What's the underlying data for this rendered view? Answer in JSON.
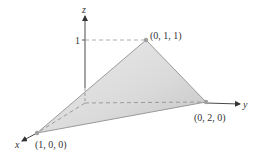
{
  "diagram": {
    "type": "3d-plane-triangle",
    "axes": {
      "x": {
        "label": "x"
      },
      "y": {
        "label": "y"
      },
      "z": {
        "label": "z",
        "tick": "1"
      }
    },
    "vertices": [
      {
        "label": "(1, 0, 0)"
      },
      {
        "label": "(0, 2, 0)"
      },
      {
        "label": "(0, 1, 1)"
      }
    ],
    "colors": {
      "axis": "#333333",
      "edge": "#9a9a9a",
      "fill_light": "#e8e8e8",
      "fill_dark": "#c9c9c9",
      "vertex": "#a0a0a0",
      "dashed": "#9a9a9a"
    }
  }
}
